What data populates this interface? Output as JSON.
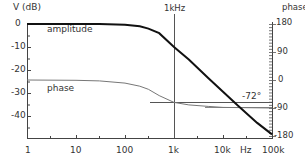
{
  "chart_data": {
    "type": "line",
    "title": "",
    "xlabel": "Hz",
    "ylabel_left": "V (dB)",
    "ylabel_right": "phase",
    "x_scale": "log",
    "x_ticks": [
      "1",
      "10",
      "100",
      "1k",
      "10k",
      "100k"
    ],
    "x_tick_values": [
      1,
      10,
      100,
      1000,
      10000,
      100000
    ],
    "y_left_ticks": [
      "0",
      "-10",
      "-20",
      "-30",
      "-40"
    ],
    "y_left_tick_values": [
      0,
      -10,
      -20,
      -30,
      -40
    ],
    "ylim_left": [
      -49,
      0
    ],
    "y_right_ticks": [
      "180",
      "90",
      "0",
      "-90",
      "-180"
    ],
    "y_right_tick_values": [
      180,
      90,
      0,
      -90,
      -180
    ],
    "ylim_right": [
      -180,
      180
    ],
    "grid": false,
    "annotations": [
      {
        "text": "1kHz",
        "type": "vertical_marker",
        "x": 1000
      },
      {
        "text": "-72°",
        "type": "horizontal_marker",
        "y_right": -72
      },
      {
        "text": "amplitude",
        "type": "series_label"
      },
      {
        "text": "phase",
        "type": "series_label"
      }
    ],
    "series": [
      {
        "name": "amplitude",
        "axis": "left",
        "x": [
          1,
          10,
          30,
          100,
          200,
          300,
          500,
          1000,
          2000,
          5000,
          10000,
          20000,
          50000,
          100000
        ],
        "values": [
          0,
          0,
          0,
          -0.3,
          -1,
          -2,
          -4,
          -10,
          -15.5,
          -23.5,
          -29.5,
          -35.5,
          -43,
          -48
        ]
      },
      {
        "name": "phase",
        "axis": "right",
        "x": [
          1,
          10,
          30,
          100,
          200,
          300,
          500,
          1000,
          2000,
          5000,
          10000,
          100000
        ],
        "values": [
          0,
          -1,
          -3,
          -10,
          -20,
          -30,
          -50,
          -72,
          -80,
          -85,
          -88,
          -90
        ]
      }
    ]
  },
  "labels": {
    "left_axis_title": "V (dB)",
    "right_axis_title": "phase",
    "marker_1khz": "1kHz",
    "marker_phase": "-72°",
    "amplitude": "amplitude",
    "phase": "phase",
    "x_unit": "Hz",
    "x_ticks": [
      "1",
      "10",
      "100",
      "1k",
      "10k",
      "100k"
    ],
    "y_left": [
      "0",
      "-10",
      "-20",
      "-30",
      "-40"
    ],
    "y_right": [
      "180",
      "90",
      "0",
      "-90",
      "-180"
    ]
  }
}
